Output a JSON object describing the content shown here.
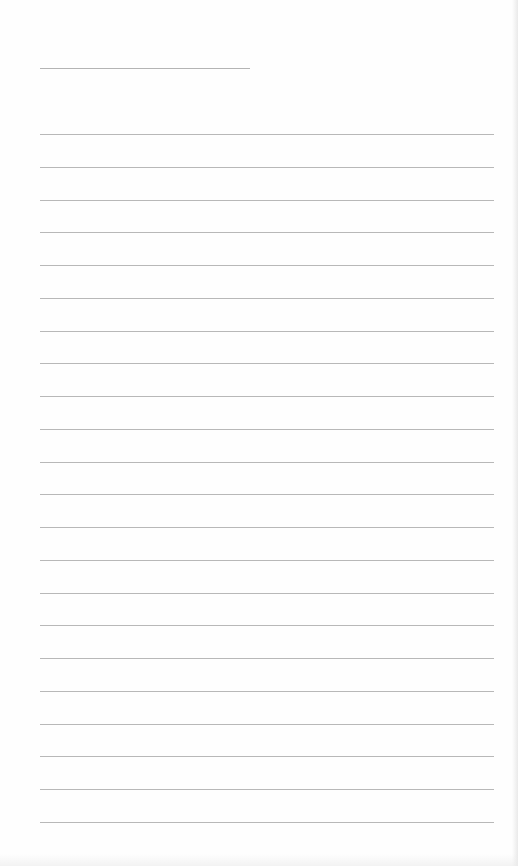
{
  "page": {
    "type": "lined-paper",
    "background": "#fefefe",
    "line_color": "#b8b8b8"
  },
  "title_field": {
    "text": "",
    "line": {
      "x1": 40,
      "x2": 250,
      "y": 68
    }
  },
  "ruled_lines": {
    "count": 22,
    "x1": 40,
    "x2": 494,
    "first_y": 134,
    "spacing": 32.76,
    "entries": [
      "",
      "",
      "",
      "",
      "",
      "",
      "",
      "",
      "",
      "",
      "",
      "",
      "",
      "",
      "",
      "",
      "",
      "",
      "",
      "",
      "",
      ""
    ]
  }
}
